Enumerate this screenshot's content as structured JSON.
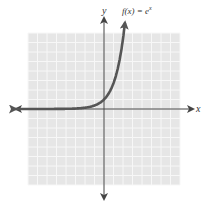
{
  "chart_data": {
    "type": "line",
    "title": "",
    "function_label": "f(x) = e^x",
    "function_label_display": "f(x) = e",
    "function_label_sup": "x",
    "xlabel": "x",
    "ylabel": "y",
    "xlim": [
      -8,
      8
    ],
    "ylim": [
      -8,
      8
    ],
    "grid": true,
    "series": [
      {
        "name": "f(x) = e^x",
        "x": [
          -8,
          -6,
          -4,
          -3,
          -2,
          -1,
          0,
          0.5,
          1,
          1.5,
          2.0,
          2.2
        ],
        "values": [
          0.0003,
          0.0025,
          0.018,
          0.05,
          0.135,
          0.368,
          1,
          1.65,
          2.72,
          4.48,
          7.39,
          9.0
        ]
      }
    ],
    "colors": {
      "curve": "#555555",
      "axes": "#444444",
      "grid_bg": "#e6e6e6",
      "grid_line": "#f7f7f7"
    }
  }
}
